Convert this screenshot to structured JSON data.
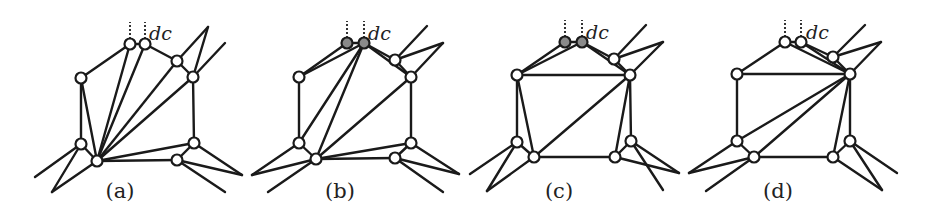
{
  "figure": {
    "panels": [
      {
        "label": "(a)",
        "label_pos": [
          120,
          198
        ],
        "dc_label": "dc",
        "dc_pos": [
          149,
          40
        ],
        "stubs": [
          [
            130,
            44
          ],
          [
            145,
            44
          ]
        ],
        "vertices": [
          {
            "x": 130,
            "y": 44,
            "fill": "#ffffff"
          },
          {
            "x": 145,
            "y": 44,
            "fill": "#ffffff"
          },
          {
            "x": 177,
            "y": 61,
            "fill": "#ffffff"
          },
          {
            "x": 193,
            "y": 77,
            "fill": "#ffffff"
          },
          {
            "x": 81,
            "y": 78,
            "fill": "#ffffff"
          },
          {
            "x": 81,
            "y": 144,
            "fill": "#ffffff"
          },
          {
            "x": 97,
            "y": 161,
            "fill": "#ffffff"
          },
          {
            "x": 194,
            "y": 143,
            "fill": "#ffffff"
          },
          {
            "x": 177,
            "y": 160,
            "fill": "#ffffff"
          }
        ],
        "edges": [
          [
            130,
            44,
            81,
            78
          ],
          [
            130,
            44,
            145,
            44
          ],
          [
            145,
            44,
            177,
            61
          ],
          [
            177,
            61,
            193,
            77
          ],
          [
            81,
            78,
            81,
            144
          ],
          [
            81,
            78,
            97,
            161
          ],
          [
            81,
            144,
            97,
            161
          ],
          [
            97,
            161,
            130,
            44
          ],
          [
            97,
            161,
            145,
            44
          ],
          [
            97,
            161,
            177,
            61
          ],
          [
            97,
            161,
            193,
            77
          ],
          [
            193,
            77,
            225,
            43
          ],
          [
            177,
            61,
            208,
            27
          ],
          [
            193,
            77,
            208,
            27
          ],
          [
            193,
            77,
            194,
            143
          ],
          [
            97,
            161,
            194,
            143
          ],
          [
            97,
            161,
            177,
            160
          ],
          [
            177,
            160,
            194,
            143
          ],
          [
            81,
            144,
            35,
            177
          ],
          [
            81,
            144,
            52,
            192
          ],
          [
            97,
            161,
            52,
            192
          ],
          [
            194,
            143,
            242,
            175
          ],
          [
            177,
            160,
            242,
            175
          ],
          [
            177,
            160,
            225,
            192
          ]
        ]
      },
      {
        "label": "(b)",
        "label_pos": [
          340,
          198
        ],
        "dc_label": "dc",
        "dc_pos": [
          368,
          40
        ],
        "stubs": [
          [
            347,
            43
          ],
          [
            364,
            43
          ]
        ],
        "vertices": [
          {
            "x": 347,
            "y": 43,
            "fill": "#8a8a8a"
          },
          {
            "x": 364,
            "y": 43,
            "fill": "#8a8a8a"
          },
          {
            "x": 395,
            "y": 60,
            "fill": "#ffffff"
          },
          {
            "x": 411,
            "y": 77,
            "fill": "#ffffff"
          },
          {
            "x": 299,
            "y": 77,
            "fill": "#ffffff"
          },
          {
            "x": 299,
            "y": 143,
            "fill": "#ffffff"
          },
          {
            "x": 316,
            "y": 159,
            "fill": "#ffffff"
          },
          {
            "x": 411,
            "y": 143,
            "fill": "#ffffff"
          },
          {
            "x": 395,
            "y": 158,
            "fill": "#ffffff"
          }
        ],
        "edges": [
          [
            299,
            77,
            347,
            43
          ],
          [
            299,
            77,
            364,
            43
          ],
          [
            347,
            43,
            364,
            43
          ],
          [
            364,
            43,
            395,
            60
          ],
          [
            364,
            43,
            411,
            77
          ],
          [
            395,
            60,
            411,
            77
          ],
          [
            299,
            77,
            299,
            143
          ],
          [
            299,
            143,
            316,
            159
          ],
          [
            299,
            143,
            364,
            43
          ],
          [
            316,
            159,
            364,
            43
          ],
          [
            316,
            159,
            411,
            77
          ],
          [
            395,
            60,
            427,
            26
          ],
          [
            395,
            60,
            443,
            43
          ],
          [
            411,
            77,
            443,
            43
          ],
          [
            411,
            77,
            411,
            143
          ],
          [
            316,
            159,
            411,
            143
          ],
          [
            316,
            159,
            395,
            158
          ],
          [
            395,
            158,
            411,
            143
          ],
          [
            299,
            143,
            252,
            175
          ],
          [
            316,
            159,
            252,
            175
          ],
          [
            316,
            159,
            268,
            192
          ],
          [
            411,
            143,
            459,
            174
          ],
          [
            395,
            158,
            459,
            174
          ],
          [
            395,
            158,
            443,
            192
          ]
        ]
      },
      {
        "label": "(c)",
        "label_pos": [
          559,
          198
        ],
        "dc_label": "dc",
        "dc_pos": [
          586,
          39
        ],
        "stubs": [
          [
            565,
            42
          ],
          [
            582,
            42
          ]
        ],
        "vertices": [
          {
            "x": 565,
            "y": 42,
            "fill": "#8a8a8a"
          },
          {
            "x": 582,
            "y": 42,
            "fill": "#8a8a8a"
          },
          {
            "x": 614,
            "y": 59,
            "fill": "#ffffff"
          },
          {
            "x": 630,
            "y": 75,
            "fill": "#ffffff"
          },
          {
            "x": 517,
            "y": 75,
            "fill": "#ffffff"
          },
          {
            "x": 517,
            "y": 142,
            "fill": "#ffffff"
          },
          {
            "x": 534,
            "y": 157,
            "fill": "#ffffff"
          },
          {
            "x": 615,
            "y": 157,
            "fill": "#ffffff"
          },
          {
            "x": 631,
            "y": 141,
            "fill": "#ffffff"
          }
        ],
        "edges": [
          [
            517,
            75,
            565,
            42
          ],
          [
            517,
            75,
            582,
            42
          ],
          [
            565,
            42,
            582,
            42
          ],
          [
            582,
            42,
            614,
            59
          ],
          [
            582,
            42,
            630,
            75
          ],
          [
            614,
            59,
            630,
            75
          ],
          [
            517,
            75,
            630,
            75
          ],
          [
            517,
            75,
            517,
            142
          ],
          [
            517,
            75,
            534,
            157
          ],
          [
            517,
            142,
            534,
            157
          ],
          [
            534,
            157,
            630,
            75
          ],
          [
            534,
            157,
            615,
            157
          ],
          [
            615,
            157,
            630,
            75
          ],
          [
            630,
            75,
            631,
            141
          ],
          [
            615,
            157,
            631,
            141
          ],
          [
            614,
            59,
            646,
            25
          ],
          [
            614,
            59,
            663,
            42
          ],
          [
            630,
            75,
            663,
            42
          ],
          [
            517,
            142,
            470,
            174
          ],
          [
            517,
            142,
            487,
            191
          ],
          [
            534,
            157,
            487,
            191
          ],
          [
            631,
            141,
            679,
            173
          ],
          [
            615,
            157,
            679,
            173
          ],
          [
            631,
            141,
            663,
            190
          ]
        ]
      },
      {
        "label": "(d)",
        "label_pos": [
          778,
          198
        ],
        "dc_label": "dc",
        "dc_pos": [
          806,
          39
        ],
        "stubs": [
          [
            785,
            42
          ],
          [
            801,
            42
          ]
        ],
        "vertices": [
          {
            "x": 785,
            "y": 42,
            "fill": "#ffffff"
          },
          {
            "x": 801,
            "y": 42,
            "fill": "#ffffff"
          },
          {
            "x": 833,
            "y": 57,
            "fill": "#ffffff"
          },
          {
            "x": 850,
            "y": 74,
            "fill": "#ffffff"
          },
          {
            "x": 737,
            "y": 74,
            "fill": "#ffffff"
          },
          {
            "x": 737,
            "y": 141,
            "fill": "#ffffff"
          },
          {
            "x": 754,
            "y": 157,
            "fill": "#ffffff"
          },
          {
            "x": 833,
            "y": 157,
            "fill": "#ffffff"
          },
          {
            "x": 850,
            "y": 141,
            "fill": "#ffffff"
          }
        ],
        "edges": [
          [
            737,
            74,
            785,
            42
          ],
          [
            785,
            42,
            801,
            42
          ],
          [
            785,
            42,
            850,
            74
          ],
          [
            801,
            42,
            833,
            57
          ],
          [
            801,
            42,
            850,
            74
          ],
          [
            833,
            57,
            850,
            74
          ],
          [
            737,
            74,
            850,
            74
          ],
          [
            737,
            74,
            737,
            141
          ],
          [
            737,
            141,
            850,
            74
          ],
          [
            754,
            157,
            850,
            74
          ],
          [
            737,
            141,
            754,
            157
          ],
          [
            754,
            157,
            833,
            157
          ],
          [
            833,
            157,
            850,
            74
          ],
          [
            850,
            74,
            850,
            141
          ],
          [
            833,
            157,
            850,
            141
          ],
          [
            833,
            57,
            865,
            25
          ],
          [
            833,
            57,
            881,
            42
          ],
          [
            850,
            74,
            881,
            42
          ],
          [
            737,
            141,
            689,
            173
          ],
          [
            754,
            157,
            689,
            173
          ],
          [
            754,
            157,
            706,
            191
          ],
          [
            850,
            141,
            897,
            173
          ],
          [
            833,
            157,
            882,
            190
          ],
          [
            850,
            141,
            882,
            190
          ]
        ]
      }
    ],
    "colors": {
      "edge": "#1a1a1a",
      "vertex_open": "#ffffff",
      "vertex_marked": "#8a8a8a"
    }
  }
}
